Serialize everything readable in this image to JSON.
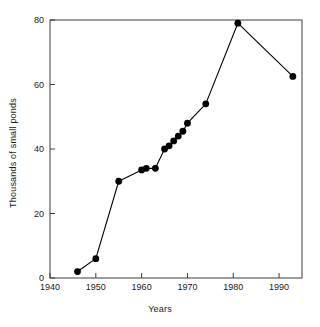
{
  "chart_data": {
    "type": "line",
    "title": "",
    "subtitle": "",
    "xlabel": "Years",
    "ylabel": "Thousands of small ponds",
    "xlim": [
      1940,
      1995
    ],
    "ylim": [
      0,
      80
    ],
    "xticks": [
      1940,
      1950,
      1960,
      1970,
      1980,
      1990
    ],
    "xticklabels": [
      "1940",
      "1950",
      "1960",
      "1970",
      "1980",
      "1990"
    ],
    "yticks": [
      0,
      20,
      40,
      60,
      80
    ],
    "yticklabels": [
      "0",
      "20",
      "40",
      "60",
      "80"
    ],
    "grid": false,
    "legend": null,
    "marker": "filled-circle",
    "marker_color": "#000000",
    "line_color": "#000000",
    "series": [
      {
        "name": "Small ponds",
        "x": [
          1946,
          1950,
          1955,
          1960,
          1961,
          1963,
          1965,
          1966,
          1967,
          1968,
          1969,
          1970,
          1974,
          1981,
          1993
        ],
        "values": [
          2,
          6,
          30,
          33.5,
          34,
          34,
          40,
          41,
          42.5,
          44,
          45.5,
          48,
          54,
          79,
          62.5
        ]
      }
    ],
    "annotations": []
  },
  "axis": {
    "x_label": "Years",
    "y_label": "Thousands of small ponds"
  }
}
